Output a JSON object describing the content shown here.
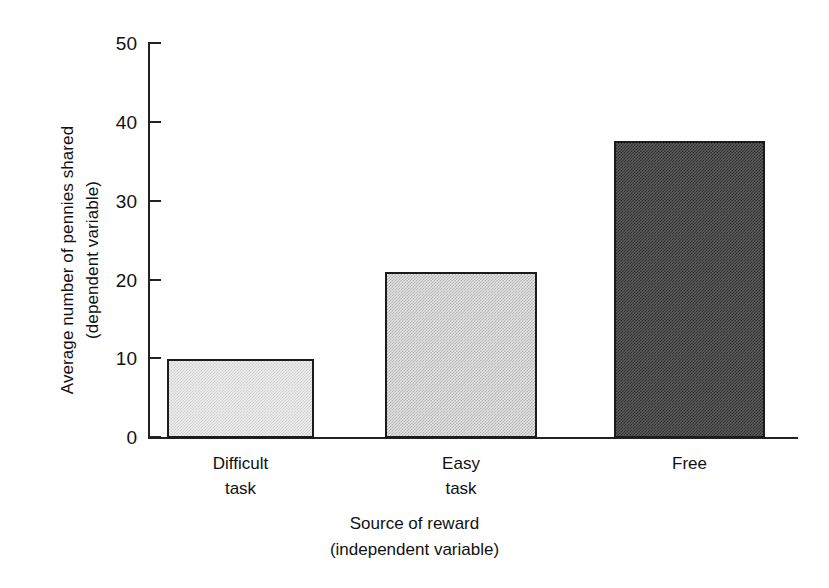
{
  "chart_data": {
    "type": "bar",
    "title": "",
    "categories": [
      "Difficult task",
      "Easy task",
      "Free"
    ],
    "category_lines": [
      [
        "Difficult",
        "task"
      ],
      [
        "Easy",
        "task"
      ],
      [
        "Free",
        ""
      ]
    ],
    "values": [
      10,
      21,
      37.5
    ],
    "series": [
      {
        "name": "Average number of pennies shared",
        "values": [
          10,
          21,
          37.5
        ]
      }
    ],
    "xlabel": "Source of reward",
    "xlabel_sub": "(independent variable)",
    "ylabel": "Average number of pennies shared",
    "ylabel_sub": "(dependent variable)",
    "ylim": [
      0,
      50
    ],
    "yticks": [
      0,
      10,
      20,
      30,
      40,
      50
    ],
    "ytick_labels": [
      "0",
      "10",
      "20",
      "30",
      "40",
      "50"
    ],
    "grid": false,
    "legend": "none",
    "bar_fills": [
      "light-checker",
      "medium-checker",
      "dark-checker"
    ],
    "bar_colors": [
      "#ededed",
      "#e2e2e2",
      "#5b5b5b"
    ],
    "bar_edge_color": "#1b1b1b",
    "axis_color": "#222222",
    "background_color": "#ffffff"
  },
  "axes": {
    "y_title_line1": "Average number of pennies shared",
    "y_title_line2": "(dependent variable)",
    "x_title_line1": "Source of reward",
    "x_title_line2": "(independent variable)"
  },
  "ticks": {
    "t0": "0",
    "t1": "10",
    "t2": "20",
    "t3": "30",
    "t4": "40",
    "t5": "50"
  },
  "categories": {
    "c0_line1": "Difficult",
    "c0_line2": "task",
    "c1_line1": "Easy",
    "c1_line2": "task",
    "c2_line1": "Free"
  }
}
